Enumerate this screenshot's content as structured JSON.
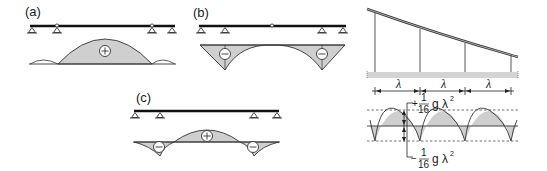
{
  "panels": {
    "a": {
      "label": "(a)",
      "moment_sign": "+",
      "description": "Continuous beam with two hinges, positive moment in central span"
    },
    "b": {
      "label": "(b)",
      "moment_signs": [
        "−",
        "−"
      ],
      "description": "Beam with central hinge, negative moments over inner supports"
    },
    "c": {
      "label": "(c)",
      "moment_signs": [
        "−",
        "+",
        "−"
      ],
      "description": "Continuous beam, negative moments at supports, positive in span"
    },
    "suspension": {
      "span_label": "λ",
      "span_labels": [
        "λ",
        "λ",
        "λ"
      ],
      "max_moment": {
        "sign": "+",
        "numerator": "1",
        "denominator": "16",
        "expr": "g λ",
        "exponent": "2"
      },
      "min_moment": {
        "sign": "−",
        "numerator": "1",
        "denominator": "16",
        "expr": "g λ",
        "exponent": "2"
      }
    }
  },
  "colors": {
    "fill": "#cfcfcf",
    "line": "#222222",
    "beam": "#111111",
    "deck": "#d4d4d4"
  }
}
